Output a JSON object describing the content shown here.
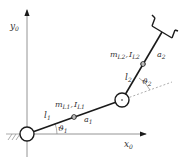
{
  "diagram": {
    "colors": {
      "link": "#1a1a1a",
      "axis": "#666666",
      "dashed": "#999999",
      "text": "#333333"
    },
    "axes": {
      "x_label": "x",
      "x_sub": "0",
      "y_label": "y",
      "y_sub": "0"
    },
    "link1": {
      "length_label": "l",
      "length_sub": "1",
      "mass_label": "m",
      "mass_sub": "L1",
      "inertia_label": "I",
      "inertia_sub": "L1",
      "com_label": "a",
      "com_sub": "1",
      "angle_label": "ϑ",
      "angle_sub": "1"
    },
    "link2": {
      "length_label": "l",
      "length_sub": "2",
      "mass_label": "m",
      "mass_sub": "L2",
      "inertia_label": "I",
      "inertia_sub": "L2",
      "com_label": "a",
      "com_sub": "2",
      "angle_label": "ϑ",
      "angle_sub": "2"
    },
    "separator": ","
  }
}
